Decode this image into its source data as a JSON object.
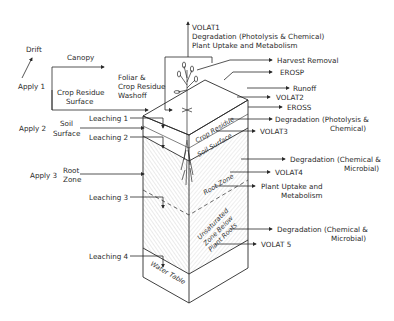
{
  "diagram": {
    "applications": {
      "drift": "Drift",
      "apply1": "Apply 1",
      "apply2": "Apply 2",
      "apply3": "Apply 3"
    },
    "compartments": {
      "canopy": "Canopy",
      "crop_residue_surface_line1": "Crop Residue",
      "crop_residue_surface_line2": "Surface",
      "foliar_line1": "Foliar &",
      "foliar_line2": "Crop Residue",
      "foliar_line3": "Washoff",
      "soil_surface_line1": "Soil",
      "soil_surface_line2": "Surface",
      "root_zone_line1": "Root",
      "root_zone_line2": "Zone"
    },
    "block_labels": {
      "crop_residue": "Crop Residue",
      "soil_surface": "Soil Surface",
      "root_zone": "Root Zone",
      "unsaturated_line1": "Unsaturated",
      "unsaturated_line2": "Zone Below",
      "unsaturated_line3": "Plant Roots",
      "water_table": "Water Table"
    },
    "leaching": [
      "Leaching 1",
      "Leaching 2",
      "Leaching 3",
      "Leaching 4"
    ],
    "top_outputs": {
      "line1": "VOLAT1",
      "line2": "Degradation (Photolysis & Chemical)",
      "line3": "Plant Uptake and Metabolism"
    },
    "right_outputs": {
      "harvest": "Harvest Removal",
      "erosp": "EROSP",
      "runoff": "Runoff",
      "volat2": "VOLAT2",
      "eross": "EROSS",
      "deg_photo_line1": "Degradation (Photolysis &",
      "deg_photo_line2": "Chemical)",
      "volat3": "VOLAT3",
      "deg_chem1_line1": "Degradation (Chemical &",
      "deg_chem1_line2": "Microbial)",
      "volat4": "VOLAT4",
      "uptake_line1": "Plant Uptake and",
      "uptake_line2": "Metabolism",
      "deg_chem2_line1": "Degradation (Chemical &",
      "deg_chem2_line2": "Microbial)",
      "volat5": "VOLAT 5"
    }
  }
}
